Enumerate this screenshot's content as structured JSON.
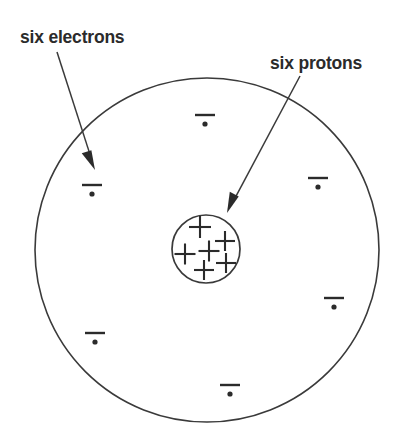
{
  "figure": {
    "background_color": "#ffffff",
    "stroke_color": "#3a3a3a",
    "text_color": "#2b2b2b"
  },
  "labels": {
    "electrons": {
      "text": "six electrons",
      "x": 20,
      "y": 43
    },
    "protons": {
      "text": "six protons",
      "x": 270,
      "y": 69
    }
  },
  "arrows": {
    "electrons_arrow": {
      "from_x": 57,
      "from_y": 52,
      "to_x": 95,
      "to_y": 170
    },
    "protons_arrow": {
      "from_x": 300,
      "from_y": 76,
      "to_x": 227,
      "to_y": 213
    }
  },
  "electron_shell": {
    "name": "electron-shell-circle",
    "cx": 207,
    "cy": 250,
    "r": 172
  },
  "nucleus": {
    "name": "nucleus-circle",
    "cx": 206,
    "cy": 249,
    "r": 34,
    "proton_count": 6,
    "proton_symbol": "+",
    "protons": [
      {
        "x": 200,
        "y": 227,
        "size": 22
      },
      {
        "x": 225,
        "y": 241,
        "size": 20
      },
      {
        "x": 185,
        "y": 254,
        "size": 21
      },
      {
        "x": 209,
        "y": 251,
        "size": 21
      },
      {
        "x": 226,
        "y": 263,
        "size": 20
      },
      {
        "x": 204,
        "y": 270,
        "size": 20
      }
    ]
  },
  "electrons": {
    "count": 6,
    "symbol": "−",
    "items": [
      {
        "name": "electron-top",
        "x": 205,
        "y": 115
      },
      {
        "name": "electron-upper-left",
        "x": 92,
        "y": 185
      },
      {
        "name": "electron-upper-right",
        "x": 318,
        "y": 178
      },
      {
        "name": "electron-lower-right",
        "x": 334,
        "y": 298
      },
      {
        "name": "electron-lower-left",
        "x": 95,
        "y": 333
      },
      {
        "name": "electron-bottom",
        "x": 230,
        "y": 385
      }
    ]
  }
}
